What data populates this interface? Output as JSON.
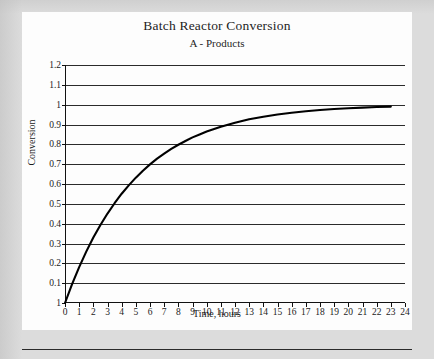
{
  "figure": {
    "title": "Batch Reactor Conversion",
    "subtitle": "A - Products"
  },
  "chart_data": {
    "type": "line",
    "title": "Batch Reactor Conversion",
    "subtitle": "A - Products",
    "xlabel": "Time, hours",
    "ylabel": "Conversion",
    "xlim": [
      0,
      24
    ],
    "ylim": [
      0,
      1.2
    ],
    "xticks": [
      0,
      1,
      2,
      3,
      4,
      5,
      6,
      7,
      8,
      9,
      10,
      11,
      12,
      13,
      14,
      15,
      16,
      17,
      18,
      19,
      20,
      21,
      22,
      23,
      24
    ],
    "xtick_labels": [
      "0",
      "1",
      "2",
      "3",
      "4",
      "5",
      "6",
      "7",
      "8",
      "9",
      "10",
      "11",
      "12",
      "13",
      "14",
      "15",
      "16",
      "17",
      "18",
      "19",
      "20",
      "21",
      "22",
      "23",
      "24"
    ],
    "yticks": [
      0,
      0.1,
      0.2,
      0.3,
      0.4,
      0.5,
      0.6,
      0.7,
      0.8,
      0.9,
      1,
      1.1,
      1.2
    ],
    "ytick_labels": [
      "1",
      "0.1",
      "0.2",
      "0.3",
      "0.4",
      "0.5",
      "0.6",
      "0.7",
      "0.8",
      "0.9",
      "1",
      "1.1",
      "1.2"
    ],
    "grid": "horizontal",
    "legend": "none",
    "line_color": "#000000",
    "line_width": 2.1,
    "series": [
      {
        "name": "Conversion",
        "x": [
          0,
          0.5,
          1,
          1.5,
          2,
          2.5,
          3,
          3.5,
          4,
          4.5,
          5,
          5.5,
          6,
          6.5,
          7,
          7.5,
          8,
          8.5,
          9,
          9.5,
          10,
          11,
          12,
          13,
          14,
          15,
          16,
          17,
          18,
          19,
          20,
          21,
          22,
          23
        ],
        "y": [
          0,
          0.095,
          0.181,
          0.259,
          0.33,
          0.393,
          0.451,
          0.503,
          0.551,
          0.593,
          0.632,
          0.667,
          0.699,
          0.728,
          0.753,
          0.777,
          0.798,
          0.817,
          0.835,
          0.85,
          0.865,
          0.889,
          0.909,
          0.926,
          0.939,
          0.95,
          0.959,
          0.967,
          0.973,
          0.978,
          0.982,
          0.985,
          0.988,
          0.99
        ]
      }
    ]
  }
}
